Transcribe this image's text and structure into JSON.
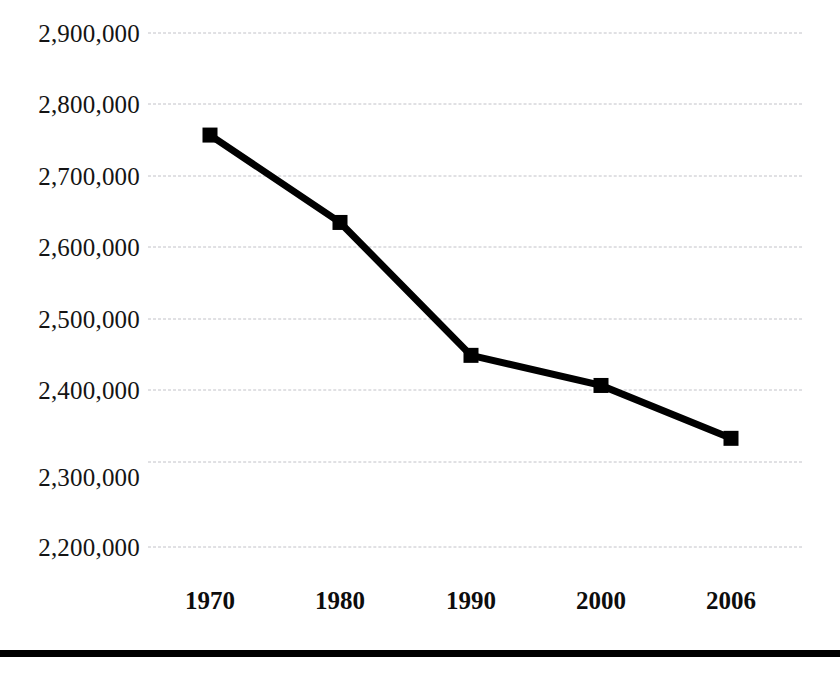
{
  "chart_data": {
    "type": "line",
    "title": "",
    "subtitle": "",
    "xlabel": "",
    "ylabel": "",
    "categories": [
      "1970",
      "1980",
      "1990",
      "2000",
      "2006"
    ],
    "values": [
      2761000,
      2642000,
      2461000,
      2420000,
      2348000
    ],
    "series": [
      {
        "name": "population",
        "values": [
          2761000,
          2642000,
          2461000,
          2420000,
          2348000
        ]
      }
    ],
    "ylim": [
      2200000,
      2900000
    ],
    "y_ticks": [
      2900000,
      2800000,
      2700000,
      2600000,
      2500000,
      2400000,
      2300000,
      2200000
    ],
    "y_tick_labels": [
      "2,900,000",
      "2,800,000",
      "2,700,000",
      "2,600,000",
      "2,500,000",
      "2,400,000",
      "2,300,000",
      "2,200,000"
    ],
    "x_tick_labels": [
      "1970",
      "1980",
      "1990",
      "2000",
      "2006"
    ],
    "grid": true,
    "grid_style": "dashed",
    "legend": false,
    "legend_position": "none",
    "annotations": [],
    "marker": "square",
    "colors": {
      "line": "#000000",
      "marker": "#000000",
      "gridline": "#c2c2c8",
      "tick_label": "#141414",
      "background": "#ffffff",
      "rule": "#000000"
    }
  },
  "footer": {
    "rule_present": true
  }
}
